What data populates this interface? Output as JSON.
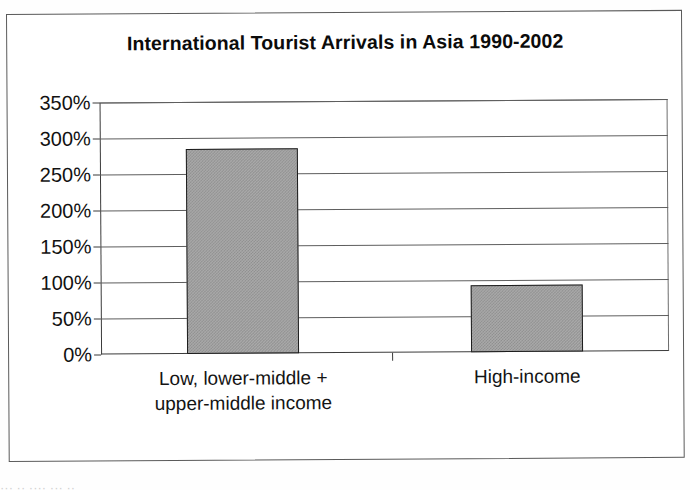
{
  "figure": {
    "border_color": "#5a5a5a",
    "background": "#ffffff"
  },
  "chart_data": {
    "type": "bar",
    "title": "International Tourist Arrivals in Asia 1990-2002",
    "xlabel": "",
    "ylabel": "",
    "categories": [
      "Low, lower-middle + upper-middle income",
      "High-income"
    ],
    "category_lines": [
      [
        "Low, lower-middle +",
        "upper-middle income"
      ],
      [
        "High-income"
      ]
    ],
    "values": [
      285,
      93
    ],
    "value_labels": [
      "285%",
      "93%"
    ],
    "ylim": [
      0,
      350
    ],
    "ytick_values": [
      0,
      50,
      100,
      150,
      200,
      250,
      300,
      350
    ],
    "ytick_labels": [
      "0%",
      "50%",
      "100%",
      "150%",
      "200%",
      "250%",
      "300%",
      "350%"
    ],
    "grid": true,
    "legend": false,
    "legend_position": "none",
    "bar_fill_color": "#a9a9a9",
    "bar_edge_color": "#1c1c1c",
    "gridline_color": "#5e5e5e",
    "axis_color": "#3b3b3b"
  },
  "bottom_fragment": "··· ·· ···· ··· ··"
}
